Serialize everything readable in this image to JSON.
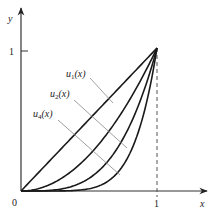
{
  "figure": {
    "y_axis_label": "y",
    "x_axis_label": "x",
    "origin_label": "0",
    "y_tick_label": "1",
    "x_tick_label": "1",
    "curves": [
      {
        "name": "u1",
        "label_base": "u",
        "label_sub": "1",
        "label_arg": "(x)",
        "exponent": 1
      },
      {
        "name": "u2",
        "label_base": "u",
        "label_sub": "2",
        "label_arg": "(x)",
        "exponent": 2
      },
      {
        "name": "u3",
        "exponent": 3.5
      },
      {
        "name": "u4",
        "label_base": "u",
        "label_sub": "4",
        "label_arg": "(x)",
        "exponent": 6
      }
    ],
    "colors": {
      "curve": "#1a1a1a",
      "axis": "#333333",
      "leader": "#888888",
      "dashed": "#555555"
    }
  }
}
